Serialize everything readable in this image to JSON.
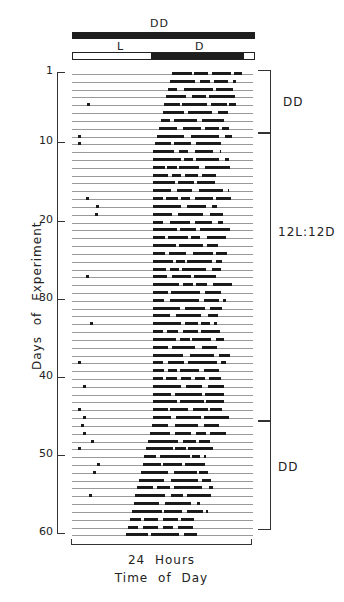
{
  "figure": {
    "top_bar_label": "DD",
    "ld_bar": {
      "light_label": "L",
      "dark_label": "D",
      "dark_start_frac": 0.43,
      "dark_end_frac": 0.94
    },
    "y_axis": {
      "title": "Days of Experiment",
      "ticks": [
        "1",
        "10",
        "20",
        "30",
        "40",
        "50",
        "60"
      ]
    },
    "conditions": [
      {
        "label": "DD",
        "days": "1-9"
      },
      {
        "label": "12L:12D",
        "days": "9-45"
      },
      {
        "label": "DD",
        "days": "45-60"
      }
    ],
    "span_label": "24 Hours",
    "x_axis_title": "Time of Day",
    "colors": {
      "ink": "#1e1e1e",
      "baseline": "#9a9a9a",
      "background": "#ffffff"
    }
  },
  "chart_data": {
    "type": "actogram",
    "title": "",
    "xlabel": "Time of Day",
    "ylabel": "Days of Experiment",
    "x_span": "24 Hours",
    "yticks": [
      1,
      10,
      20,
      30,
      40,
      50,
      60
    ],
    "ylim": [
      1,
      60
    ],
    "lighting_schedule": [
      {
        "condition": "DD",
        "start_day": 1,
        "end_day": 9
      },
      {
        "condition": "12L:12D",
        "start_day": 9,
        "end_day": 45
      },
      {
        "condition": "DD",
        "start_day": 45,
        "end_day": 60
      }
    ],
    "activity_onset_frac": [
      0.55,
      0.54,
      0.53,
      0.52,
      0.51,
      0.5,
      0.49,
      0.48,
      0.47,
      0.46,
      0.45,
      0.45,
      0.45,
      0.45,
      0.45,
      0.45,
      0.45,
      0.45,
      0.45,
      0.45,
      0.45,
      0.45,
      0.45,
      0.45,
      0.45,
      0.45,
      0.45,
      0.45,
      0.45,
      0.45,
      0.45,
      0.45,
      0.45,
      0.45,
      0.45,
      0.45,
      0.45,
      0.45,
      0.45,
      0.45,
      0.45,
      0.45,
      0.45,
      0.45,
      0.45,
      0.44,
      0.43,
      0.42,
      0.41,
      0.4,
      0.39,
      0.38,
      0.37,
      0.36,
      0.35,
      0.34,
      0.33,
      0.32,
      0.31,
      0.3
    ],
    "activity_duration_frac": 0.4
  }
}
